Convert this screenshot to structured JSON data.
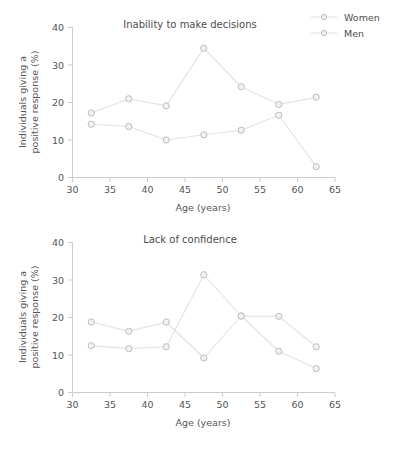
{
  "figure": {
    "background_color": "#ffffff",
    "line_color": "#e2e2e2",
    "marker_fill_color": "#f2f2f2",
    "marker_edge_color": "#bdbdbd",
    "axis_color": "#cccccc",
    "text_color": "#555555"
  },
  "legend": {
    "position": "top-right",
    "entries": [
      {
        "label": "Women",
        "marker": "open-circle"
      },
      {
        "label": "Men",
        "marker": "open-circle"
      }
    ]
  },
  "axis_common": {
    "xlabel": "Age (years)",
    "ylabel_line1": "Individuals giving a",
    "ylabel_line2": "positive response (%)",
    "xlim": [
      30,
      65
    ],
    "ylim": [
      0,
      40
    ],
    "xticks": [
      30,
      35,
      40,
      45,
      50,
      55,
      60,
      65
    ],
    "yticks": [
      0,
      10,
      20,
      30,
      40
    ],
    "xtick_labels": [
      "30",
      "35",
      "40",
      "45",
      "50",
      "55",
      "60",
      "65"
    ],
    "ytick_labels": [
      "0",
      "10",
      "20",
      "30",
      "40"
    ],
    "grid": false
  },
  "chart_data": [
    {
      "type": "line",
      "title": "Inability to make decisions",
      "xlabel": "Age (years)",
      "ylabel": "Individuals giving a positive response (%)",
      "xlim": [
        30,
        65
      ],
      "ylim": [
        0,
        40
      ],
      "x": [
        32.5,
        37.5,
        42.5,
        47.5,
        52.5,
        57.5,
        62.5
      ],
      "grid": false,
      "legend_position": "top-right",
      "series": [
        {
          "name": "Women",
          "values": [
            17.2,
            21.0,
            19.1,
            34.5,
            24.2,
            19.5,
            21.4
          ]
        },
        {
          "name": "Men",
          "values": [
            14.2,
            13.6,
            10.0,
            11.4,
            12.6,
            16.6,
            2.9
          ]
        }
      ]
    },
    {
      "type": "line",
      "title": "Lack of confidence",
      "xlabel": "Age (years)",
      "ylabel": "Individuals giving a positive response (%)",
      "xlim": [
        30,
        65
      ],
      "ylim": [
        0,
        40
      ],
      "x": [
        32.5,
        37.5,
        42.5,
        47.5,
        52.5,
        57.5,
        62.5
      ],
      "grid": false,
      "legend_position": "none",
      "series": [
        {
          "name": "Women",
          "values": [
            18.8,
            16.3,
            18.8,
            9.2,
            20.4,
            20.3,
            12.2
          ]
        },
        {
          "name": "Men",
          "values": [
            12.5,
            11.7,
            12.2,
            31.4,
            20.4,
            11.0,
            6.4
          ]
        }
      ]
    }
  ]
}
